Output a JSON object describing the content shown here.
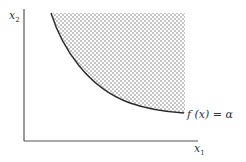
{
  "diagram": {
    "axes": {
      "x_label": {
        "base": "x",
        "subscript": "1"
      },
      "y_label": {
        "base": "x",
        "subscript": "2"
      }
    },
    "curve_label": "f (x) = α",
    "colors": {
      "axis": "#555555",
      "curve": "#2b2b2b",
      "dots": "#6e6e6e",
      "text": "#333333",
      "background": "#ffffff"
    }
  }
}
